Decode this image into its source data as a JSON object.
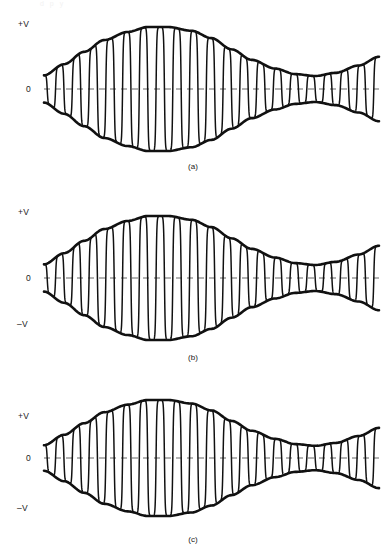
{
  "figure": {
    "kind": "am-waveform-triptych",
    "background_color": "#ffffff",
    "stroke_color": "#111111",
    "zero_line_color": "#9a9a9a",
    "top_artifact_text": "d p y"
  },
  "panels": [
    {
      "id": "a",
      "caption": "(a)",
      "labels": {
        "positive": "+V",
        "zero": "0",
        "negative": ""
      },
      "has_negative_label": false
    },
    {
      "id": "b",
      "caption": "(b)",
      "labels": {
        "positive": "+V",
        "zero": "0",
        "negative": "–V"
      },
      "has_negative_label": true
    },
    {
      "id": "c",
      "caption": "(c)",
      "labels": {
        "positive": "+V",
        "zero": "0",
        "negative": "–V"
      },
      "has_negative_label": true
    }
  ],
  "chart_data": {
    "type": "line",
    "title": "",
    "subtitle": "",
    "xlabel": "",
    "ylabel": "",
    "grid": false,
    "legend": null,
    "axis": {
      "y_ticks": [
        "+V",
        "0",
        "–V"
      ],
      "y_tick_values": [
        1,
        0,
        -1
      ],
      "ylim": [
        -1.15,
        1.15
      ],
      "xlim": [
        0,
        1
      ],
      "x_ticks": []
    },
    "series": [
      {
        "name": "envelope-upper-a",
        "role": "modulation-envelope-upper",
        "x": [
          0.0,
          0.06,
          0.12,
          0.18,
          0.25,
          0.31,
          0.37,
          0.44,
          0.5,
          0.56,
          0.62,
          0.69,
          0.75,
          0.81,
          0.87,
          0.94,
          1.0
        ],
        "values": [
          0.22,
          0.4,
          0.6,
          0.79,
          0.92,
          1.0,
          1.0,
          0.94,
          0.82,
          0.64,
          0.47,
          0.33,
          0.24,
          0.21,
          0.26,
          0.38,
          0.52
        ]
      },
      {
        "name": "envelope-lower-a",
        "role": "modulation-envelope-lower",
        "x": [
          0.0,
          0.06,
          0.12,
          0.18,
          0.25,
          0.31,
          0.37,
          0.44,
          0.5,
          0.56,
          0.62,
          0.69,
          0.75,
          0.81,
          0.87,
          0.94,
          1.0
        ],
        "values": [
          -0.22,
          -0.4,
          -0.6,
          -0.79,
          -0.92,
          -1.0,
          -1.0,
          -0.94,
          -0.82,
          -0.64,
          -0.47,
          -0.33,
          -0.24,
          -0.21,
          -0.26,
          -0.38,
          -0.52
        ]
      },
      {
        "name": "carrier-a",
        "role": "modulated-carrier",
        "carrier_cycles": 20,
        "modulation_cycles": 1.4,
        "peak_amplitude": 1.0
      },
      {
        "name": "envelope-upper-b",
        "role": "modulation-envelope-upper",
        "x": [
          0.0,
          0.06,
          0.12,
          0.18,
          0.25,
          0.31,
          0.37,
          0.44,
          0.5,
          0.56,
          0.62,
          0.69,
          0.75,
          0.81,
          0.87,
          0.94,
          1.0
        ],
        "values": [
          0.22,
          0.4,
          0.6,
          0.79,
          0.92,
          1.0,
          1.0,
          0.94,
          0.82,
          0.64,
          0.47,
          0.33,
          0.24,
          0.21,
          0.26,
          0.38,
          0.52
        ]
      },
      {
        "name": "envelope-lower-b",
        "role": "modulation-envelope-lower",
        "x": [
          0.0,
          0.06,
          0.12,
          0.18,
          0.25,
          0.31,
          0.37,
          0.44,
          0.5,
          0.56,
          0.62,
          0.69,
          0.75,
          0.81,
          0.87,
          0.94,
          1.0
        ],
        "values": [
          -0.22,
          -0.4,
          -0.6,
          -0.79,
          -0.92,
          -1.0,
          -1.0,
          -0.94,
          -0.82,
          -0.64,
          -0.47,
          -0.33,
          -0.24,
          -0.21,
          -0.26,
          -0.38,
          -0.52
        ]
      },
      {
        "name": "carrier-b",
        "role": "modulated-carrier",
        "carrier_cycles": 20,
        "modulation_cycles": 1.4,
        "peak_amplitude": 1.0
      },
      {
        "name": "envelope-upper-c",
        "role": "modulation-envelope-upper",
        "x": [
          0.0,
          0.06,
          0.12,
          0.18,
          0.25,
          0.31,
          0.37,
          0.44,
          0.5,
          0.56,
          0.62,
          0.69,
          0.75,
          0.81,
          0.87,
          0.94,
          1.0
        ],
        "values": [
          0.22,
          0.4,
          0.6,
          0.79,
          0.92,
          1.0,
          1.0,
          0.94,
          0.82,
          0.64,
          0.47,
          0.33,
          0.24,
          0.21,
          0.26,
          0.38,
          0.52
        ]
      },
      {
        "name": "envelope-lower-c",
        "role": "modulation-envelope-lower",
        "x": [
          0.0,
          0.06,
          0.12,
          0.18,
          0.25,
          0.31,
          0.37,
          0.44,
          0.5,
          0.56,
          0.62,
          0.69,
          0.75,
          0.81,
          0.87,
          0.94,
          1.0
        ],
        "values": [
          -0.22,
          -0.4,
          -0.6,
          -0.79,
          -0.92,
          -1.0,
          -1.0,
          -0.94,
          -0.82,
          -0.64,
          -0.47,
          -0.33,
          -0.24,
          -0.21,
          -0.26,
          -0.38,
          -0.52
        ]
      },
      {
        "name": "carrier-c",
        "role": "modulated-carrier",
        "carrier_cycles": 20,
        "modulation_cycles": 1.4,
        "peak_amplitude": 1.0
      }
    ]
  }
}
